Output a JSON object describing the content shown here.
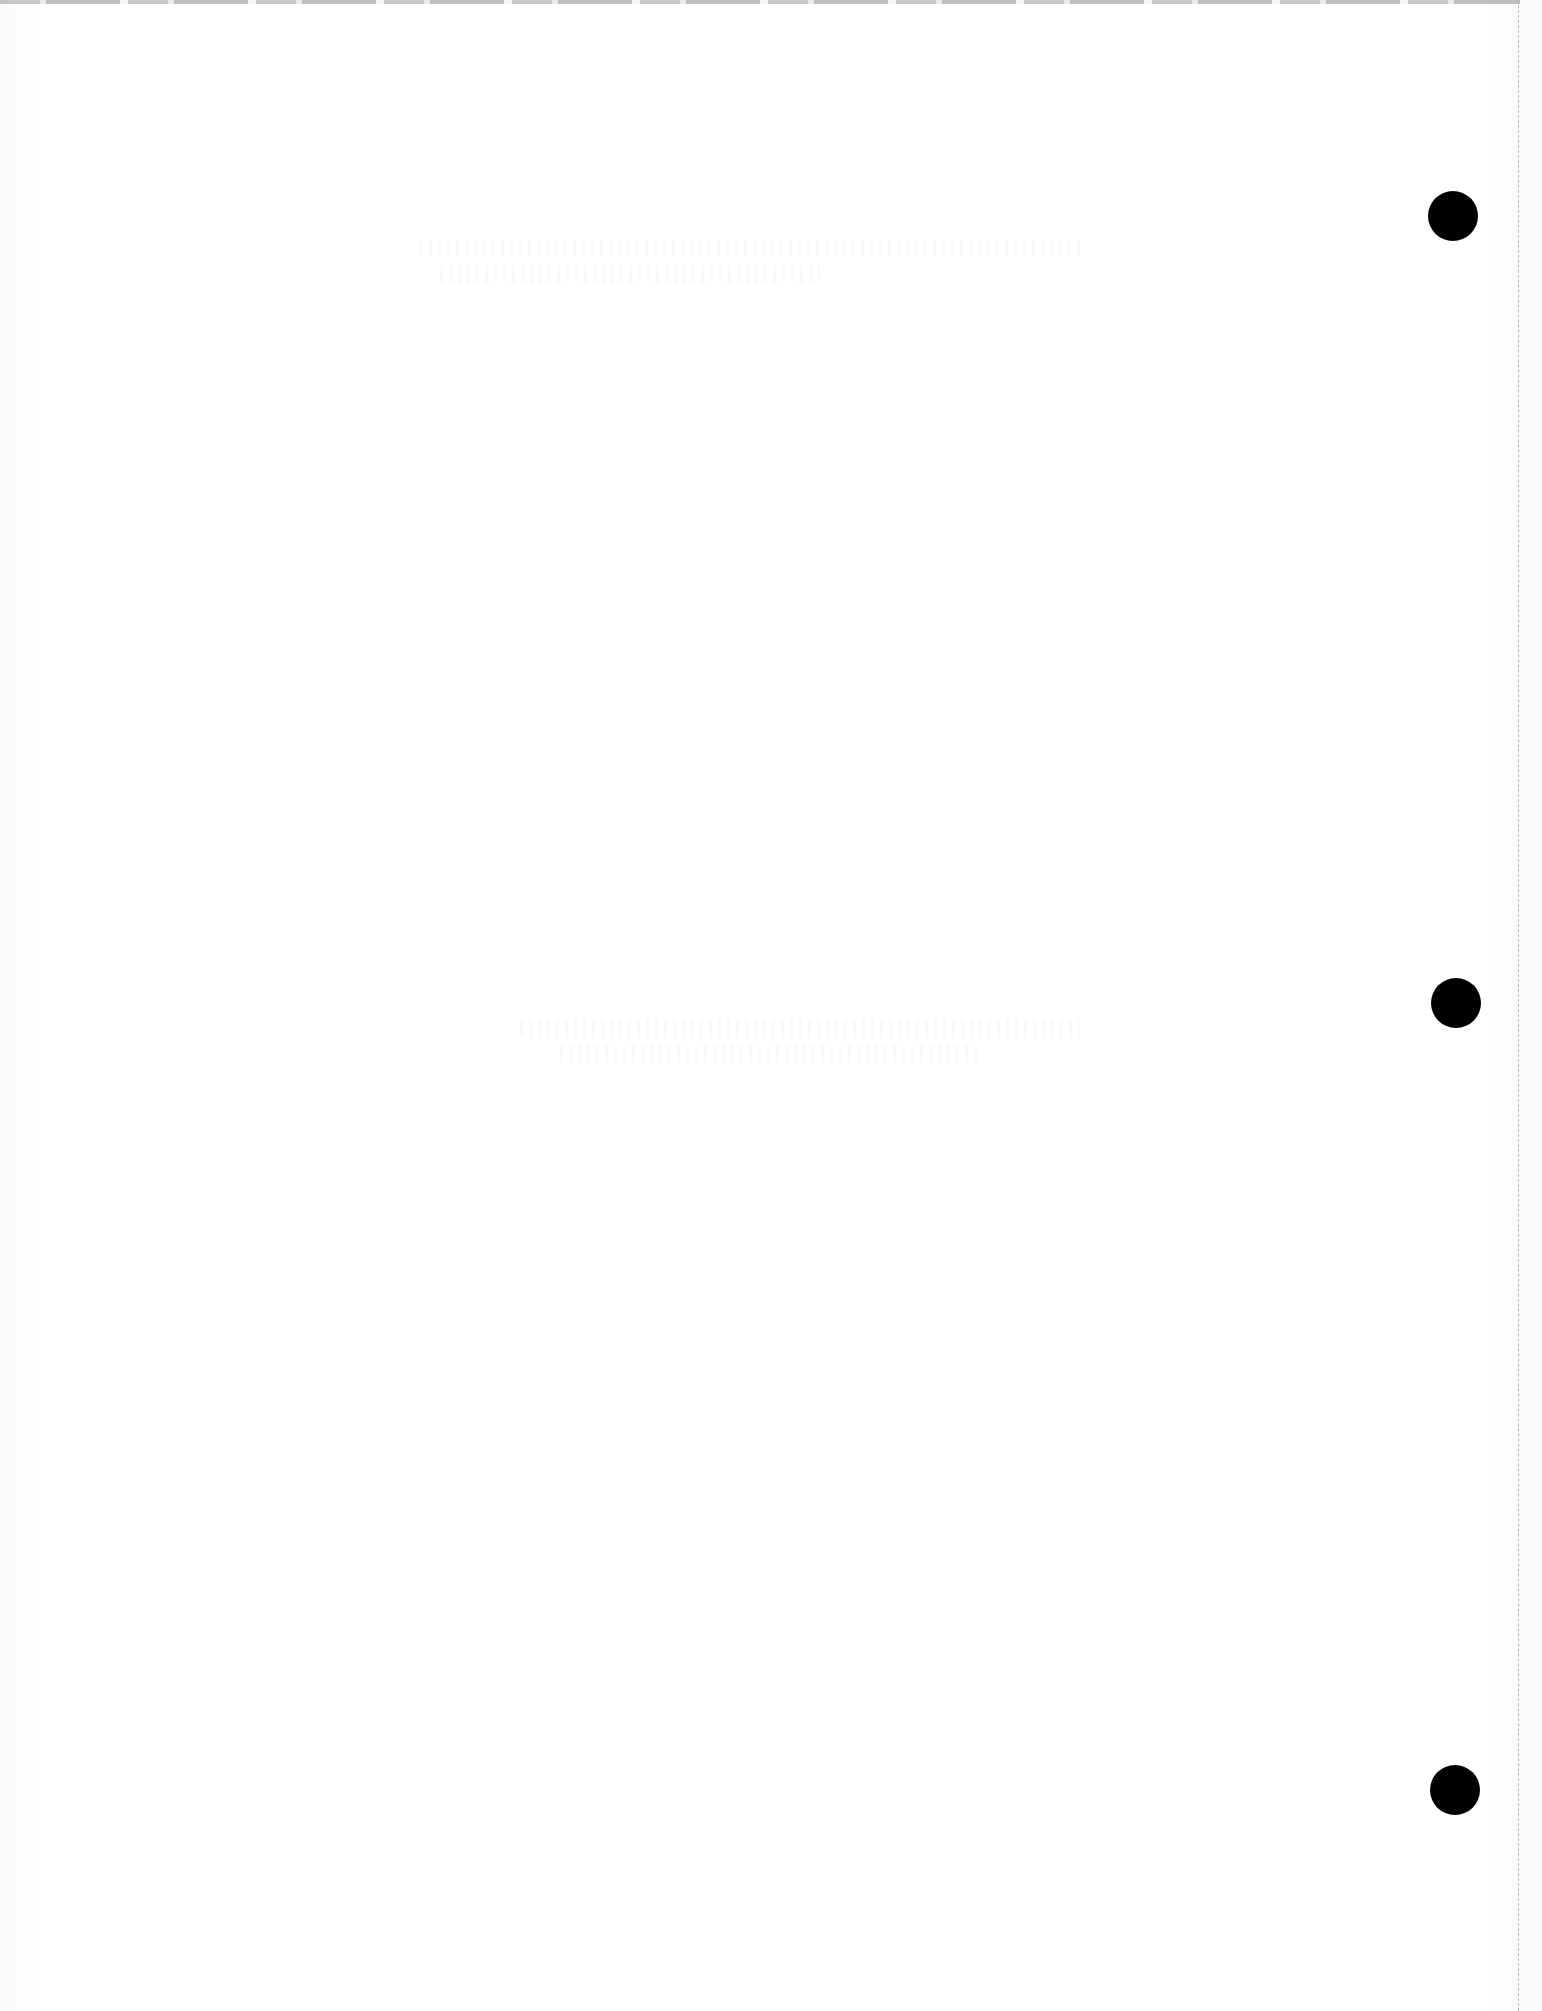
{
  "page": {
    "type": "blank-scanned-page",
    "background_color": "#ffffff",
    "text": ""
  },
  "punch_holes": [
    {
      "label": "top",
      "cx": 1453,
      "cy": 216,
      "diameter": 50,
      "color": "#000000"
    },
    {
      "label": "middle",
      "cx": 1456,
      "cy": 1003,
      "diameter": 50,
      "color": "#000000"
    },
    {
      "label": "bottom",
      "cx": 1455,
      "cy": 1790,
      "diameter": 50,
      "color": "#000000"
    }
  ],
  "perforation": {
    "style": "dashed",
    "x": 1518,
    "color": "#b9b9b9"
  }
}
